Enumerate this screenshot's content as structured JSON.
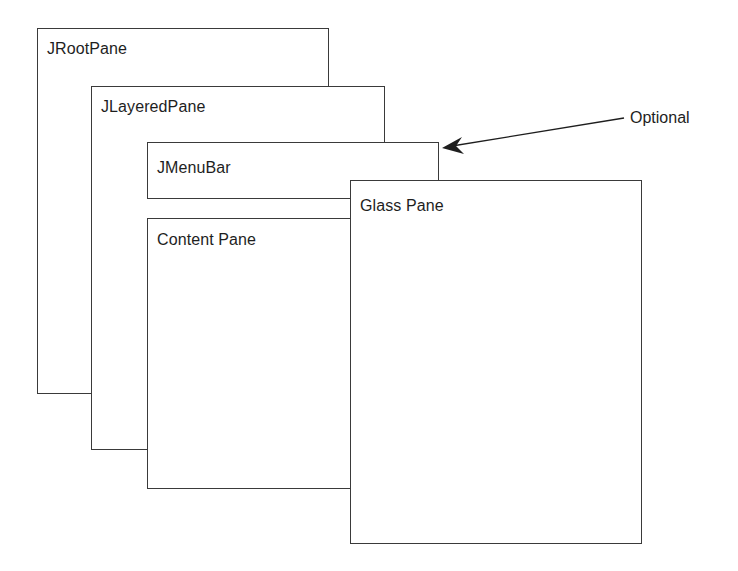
{
  "diagram": {
    "type": "layered-pane-structure",
    "panes": [
      {
        "id": "jrootpane",
        "label": "JRootPane"
      },
      {
        "id": "jlayeredpane",
        "label": "JLayeredPane"
      },
      {
        "id": "jmenubar",
        "label": "JMenuBar"
      },
      {
        "id": "contentpane",
        "label": "Content Pane"
      },
      {
        "id": "glasspane",
        "label": "Glass Pane"
      }
    ],
    "annotation": {
      "label": "Optional",
      "points_to": "JMenuBar"
    },
    "colors": {
      "stroke": "#3a3a3a",
      "text": "#1e1e1e",
      "background": "#ffffff"
    }
  }
}
